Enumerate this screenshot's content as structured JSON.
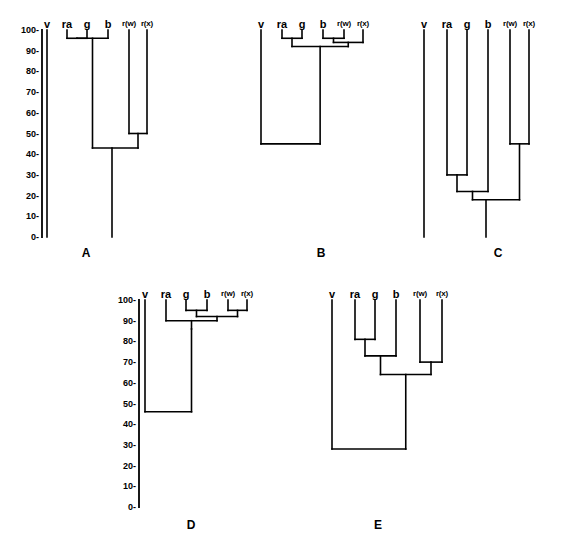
{
  "figure": {
    "running_header": "",
    "taxa": [
      "v",
      "ra",
      "g",
      "b",
      "r(w)",
      "r(x)"
    ],
    "axis": {
      "min": 0,
      "max": 100,
      "step": 10,
      "ticks": [
        "100-",
        "90-",
        "80-",
        "70-",
        "60-",
        "50-",
        "40-",
        "30-",
        "20-",
        "10-",
        "0-"
      ],
      "tick_values": [
        100,
        90,
        80,
        70,
        60,
        50,
        40,
        30,
        20,
        10,
        0
      ]
    },
    "panel_labels": [
      "A",
      "B",
      "C",
      "D",
      "E"
    ],
    "line_color": "#000000",
    "background_color": "#ffffff"
  },
  "chart_data": {
    "type": "diagram",
    "subtype": "dendrogram-grid",
    "title": "",
    "xlabel": "",
    "ylabel": "",
    "ylim": [
      0,
      100
    ],
    "grid": false,
    "legend": "none",
    "leaf_labels": [
      "v",
      "ra",
      "g",
      "b",
      "r(w)",
      "r(x)"
    ],
    "panels": [
      {
        "name": "A",
        "label": "A",
        "has_axis": true,
        "axis_side": "left",
        "leaves": [
          "v",
          "ra",
          "g",
          "b",
          "r(w)",
          "r(x)"
        ],
        "leaf_top": 100,
        "baseline": 0,
        "v_joins_root": false,
        "merges": [
          {
            "id": "m1",
            "members": [
              "ra",
              "g"
            ],
            "height": 96
          },
          {
            "id": "m2",
            "members": [
              "m1",
              "b"
            ],
            "height": 96
          },
          {
            "id": "m3",
            "members": [
              "r(w)",
              "r(x)"
            ],
            "height": 50
          },
          {
            "id": "m4",
            "members": [
              "m2",
              "m3"
            ],
            "height": 43
          }
        ],
        "root_height": 43,
        "root_descends_to": 0
      },
      {
        "name": "B",
        "label": "B",
        "has_axis": false,
        "leaves": [
          "v",
          "ra",
          "g",
          "b",
          "r(w)",
          "r(x)"
        ],
        "leaf_top": 100,
        "baseline": 45,
        "v_joins_root": true,
        "merges": [
          {
            "id": "m1",
            "members": [
              "ra",
              "g"
            ],
            "height": 96
          },
          {
            "id": "m2",
            "members": [
              "b",
              "r(w)"
            ],
            "height": 96
          },
          {
            "id": "m3",
            "members": [
              "m2",
              "r(x)"
            ],
            "height": 94
          },
          {
            "id": "m4",
            "members": [
              "m1",
              "m3"
            ],
            "height": 92
          },
          {
            "id": "m5",
            "members": [
              "v",
              "m4"
            ],
            "height": 45
          }
        ],
        "root_height": 45,
        "root_descends_to": 45
      },
      {
        "name": "C",
        "label": "C",
        "has_axis": false,
        "leaves": [
          "v",
          "ra",
          "g",
          "b",
          "r(w)",
          "r(x)"
        ],
        "leaf_top": 100,
        "baseline": 0,
        "v_joins_root": false,
        "merges": [
          {
            "id": "m1",
            "members": [
              "r(w)",
              "r(x)"
            ],
            "height": 45
          },
          {
            "id": "m2",
            "members": [
              "ra",
              "g"
            ],
            "height": 30
          },
          {
            "id": "m3",
            "members": [
              "m2",
              "b"
            ],
            "height": 22
          },
          {
            "id": "m4",
            "members": [
              "m3",
              "m1"
            ],
            "height": 18
          }
        ],
        "root_height": 18,
        "root_descends_to": 0
      },
      {
        "name": "D",
        "label": "D",
        "has_axis": true,
        "axis_side": "left",
        "leaves": [
          "v",
          "ra",
          "g",
          "b",
          "r(w)",
          "r(x)"
        ],
        "leaf_top": 100,
        "baseline": 46,
        "v_joins_root": true,
        "merges": [
          {
            "id": "m1",
            "members": [
              "g",
              "b"
            ],
            "height": 95
          },
          {
            "id": "m2",
            "members": [
              "r(w)",
              "r(x)"
            ],
            "height": 95
          },
          {
            "id": "m3",
            "members": [
              "m1",
              "m2"
            ],
            "height": 92
          },
          {
            "id": "m4",
            "members": [
              "ra",
              "m3"
            ],
            "height": 90
          },
          {
            "id": "m5",
            "members": [
              "m4"
            ],
            "height": 86
          },
          {
            "id": "m6",
            "members": [
              "v",
              "m5"
            ],
            "height": 46
          }
        ],
        "root_height": 46,
        "root_descends_to": 46
      },
      {
        "name": "E",
        "label": "E",
        "has_axis": false,
        "leaves": [
          "v",
          "ra",
          "g",
          "b",
          "r(w)",
          "r(x)"
        ],
        "leaf_top": 100,
        "baseline": 28,
        "v_joins_root": true,
        "merges": [
          {
            "id": "m1",
            "members": [
              "ra",
              "g"
            ],
            "height": 81
          },
          {
            "id": "m2",
            "members": [
              "m1",
              "b"
            ],
            "height": 73
          },
          {
            "id": "m3",
            "members": [
              "r(w)",
              "r(x)"
            ],
            "height": 70
          },
          {
            "id": "m4",
            "members": [
              "m2",
              "m3"
            ],
            "height": 64
          },
          {
            "id": "m5",
            "members": [
              "v",
              "m4"
            ],
            "height": 28
          }
        ],
        "root_height": 28,
        "root_descends_to": 28
      }
    ]
  }
}
